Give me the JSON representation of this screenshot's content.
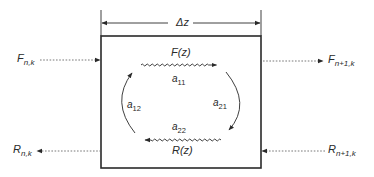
{
  "diagram": {
    "type": "transfer-matrix-section",
    "section_width_label": "Δz",
    "inputs": {
      "forward_in": {
        "base": "F",
        "sub": "n,k"
      },
      "forward_out": {
        "base": "F",
        "sub": "n+1,k"
      },
      "reverse_out": {
        "base": "R",
        "sub": "n,k"
      },
      "reverse_in": {
        "base": "R",
        "sub": "n+1,k"
      }
    },
    "internal": {
      "forward_wave": "F(z)",
      "reverse_wave": "R(z)",
      "coefficients": [
        {
          "base": "a",
          "sub": "11"
        },
        {
          "base": "a",
          "sub": "12"
        },
        {
          "base": "a",
          "sub": "21"
        },
        {
          "base": "a",
          "sub": "22"
        }
      ]
    },
    "colors": {
      "line": "#2a2a2a",
      "dashed": "#555555",
      "background": "#ffffff"
    }
  }
}
